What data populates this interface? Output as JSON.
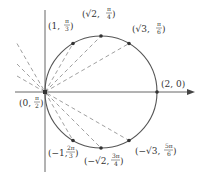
{
  "diagram": {
    "axes": {
      "polar_axis_arrow": true
    },
    "center_px": [
      101,
      92
    ],
    "radius_px": 56,
    "origin_px": [
      45,
      92
    ],
    "points": [
      {
        "id": "p1",
        "r": "1",
        "theta": "π/3",
        "px": [
          73,
          43.5
        ]
      },
      {
        "id": "p2",
        "r": "√2",
        "theta": "π/4",
        "px": [
          101,
          36
        ]
      },
      {
        "id": "p3",
        "r": "√3",
        "theta": "π/6",
        "px": [
          129,
          43.5
        ]
      },
      {
        "id": "p4",
        "r": "2",
        "theta": "0",
        "px": [
          157,
          92
        ]
      },
      {
        "id": "p5",
        "r": "−1",
        "theta": "2π/3",
        "px": [
          73,
          140.5
        ]
      },
      {
        "id": "p6",
        "r": "−√2",
        "theta": "3π/4",
        "px": [
          101,
          148
        ]
      },
      {
        "id": "p7",
        "r": "−√3",
        "theta": "5π/6",
        "px": [
          129,
          140.5
        ]
      },
      {
        "id": "p0",
        "r": "0",
        "theta": "π/2",
        "px": [
          45,
          92
        ]
      }
    ],
    "labels": {
      "p1": {
        "pre": "(1, ",
        "num": "π",
        "den": "3",
        "post": ")"
      },
      "p2": {
        "pre": "(√2, ",
        "num": "π",
        "den": "4",
        "post": ")"
      },
      "p3": {
        "pre": "(√3, ",
        "num": "π",
        "den": "6",
        "post": ")"
      },
      "p4": {
        "text": "(2, 0)"
      },
      "p5": {
        "pre": "(−1, ",
        "num": "2π",
        "den": "3",
        "post": ")"
      },
      "p6": {
        "pre": "(−√2, ",
        "num": "3π",
        "den": "4",
        "post": ")"
      },
      "p7": {
        "pre": "(−√3, ",
        "num": "5π",
        "den": "6",
        "post": ")"
      },
      "p0": {
        "pre": "(0, ",
        "num": "π",
        "den": "2",
        "post": ")"
      }
    }
  }
}
